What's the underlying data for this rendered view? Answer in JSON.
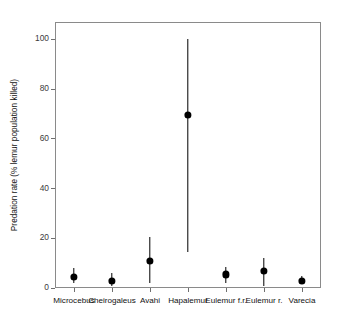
{
  "chart_data": {
    "type": "scatter",
    "title": "",
    "xlabel": "",
    "ylabel": "Predation rate (% lemur population killed)",
    "categories": [
      "Microcebus",
      "Cheirogaleus",
      "Avahi",
      "Hapalemur",
      "Eulemur f.r.",
      "Eulemur r.",
      "Varecia"
    ],
    "values": [
      4.5,
      3.0,
      11.0,
      69.5,
      5.5,
      7.0,
      3.0
    ],
    "error_low": [
      2.0,
      1.0,
      2.0,
      14.5,
      2.0,
      1.0,
      1.5
    ],
    "error_high": [
      8.0,
      6.0,
      20.5,
      100.0,
      8.5,
      12.0,
      5.0
    ],
    "ylim": [
      0,
      107
    ],
    "yticks": [
      0,
      20,
      40,
      60,
      80,
      100
    ],
    "ytick_labels": [
      "0",
      "20",
      "40",
      "60",
      "80",
      "100"
    ],
    "grid": false,
    "legend": null,
    "marker_color": "#000000",
    "frame_color": "#8a8a8a"
  }
}
